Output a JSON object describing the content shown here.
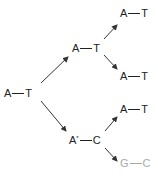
{
  "diagram": {
    "type": "replication-tree",
    "colors": {
      "normal": "#222222",
      "muted": "#a9a9a9",
      "arrow": "#333333"
    },
    "nodes": [
      {
        "id": "root",
        "left": "A",
        "right": "T",
        "mark": "",
        "style": "normal"
      },
      {
        "id": "gen1-top",
        "left": "A",
        "right": "T",
        "mark": "",
        "style": "normal"
      },
      {
        "id": "gen1-bottom",
        "left": "A",
        "right": "C",
        "mark": "*",
        "style": "normal"
      },
      {
        "id": "gen2-1",
        "left": "A",
        "right": "T",
        "mark": "",
        "style": "normal"
      },
      {
        "id": "gen2-2",
        "left": "A",
        "right": "T",
        "mark": "",
        "style": "normal"
      },
      {
        "id": "gen2-3",
        "left": "A",
        "right": "T",
        "mark": "",
        "style": "normal"
      },
      {
        "id": "gen2-4",
        "left": "G",
        "right": "C",
        "mark": "",
        "style": "muted"
      }
    ],
    "edges": [
      {
        "from": "root",
        "to": "gen1-top"
      },
      {
        "from": "root",
        "to": "gen1-bottom"
      },
      {
        "from": "gen1-top",
        "to": "gen2-1"
      },
      {
        "from": "gen1-top",
        "to": "gen2-2"
      },
      {
        "from": "gen1-bottom",
        "to": "gen2-3"
      },
      {
        "from": "gen1-bottom",
        "to": "gen2-4"
      }
    ]
  }
}
